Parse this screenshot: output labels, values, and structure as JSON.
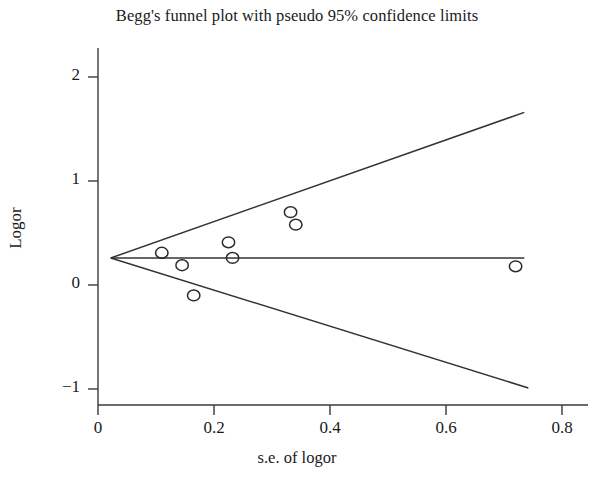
{
  "chart_data": {
    "type": "scatter",
    "title": "Begg's funnel plot with pseudo 95% confidence limits",
    "xlabel": "s.e. of logor",
    "ylabel": "Logor",
    "xlim": [
      -0.02,
      0.86
    ],
    "ylim": [
      -1.22,
      2.32
    ],
    "xticks": [
      0,
      0.2,
      0.4,
      0.6,
      0.8
    ],
    "xtick_labels": [
      "0",
      "0.2",
      "0.4",
      "0.6",
      "0.8"
    ],
    "yticks": [
      2,
      1,
      0,
      -1
    ],
    "ytick_labels": [
      "2",
      "1",
      "0",
      "−1"
    ],
    "grid": false,
    "legend": false,
    "points": [
      {
        "x": 0.11,
        "y": 0.31
      },
      {
        "x": 0.145,
        "y": 0.19
      },
      {
        "x": 0.165,
        "y": -0.1
      },
      {
        "x": 0.225,
        "y": 0.41
      },
      {
        "x": 0.232,
        "y": 0.26
      },
      {
        "x": 0.332,
        "y": 0.7
      },
      {
        "x": 0.341,
        "y": 0.58
      },
      {
        "x": 0.72,
        "y": 0.18
      }
    ],
    "reference_line": {
      "name": "pooled logor",
      "y": 0.26,
      "x_from": 0.022,
      "x_to": 0.735
    },
    "pseudo_95_limits": {
      "apex": {
        "x": 0.022,
        "y": 0.26
      },
      "upper_end": {
        "x": 0.735,
        "y": 1.66
      },
      "lower_end": {
        "x": 0.742,
        "y": -0.99
      }
    }
  },
  "axes": {
    "title": "Begg's funnel plot with pseudo 95% confidence limits",
    "xlabel": "s.e. of logor",
    "ylabel": "Logor"
  }
}
